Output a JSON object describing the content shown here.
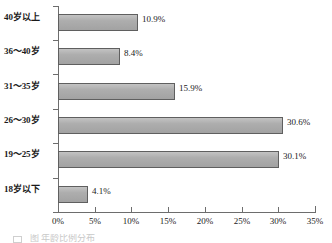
{
  "chart_data": {
    "type": "bar",
    "orientation": "horizontal",
    "title": "",
    "xlabel": "",
    "ylabel": "",
    "categories": [
      "18岁以下",
      "19～25岁",
      "26～30岁",
      "31～35岁",
      "36～40岁",
      "40岁以上"
    ],
    "values": [
      4.1,
      30.1,
      30.6,
      15.9,
      8.4,
      10.9
    ],
    "data_labels": [
      "4.1%",
      "30.1%",
      "30.6%",
      "15.9%",
      "8.4%",
      "10.9%"
    ],
    "xlim": [
      0,
      35
    ],
    "xtick_values": [
      0,
      5,
      10,
      15,
      20,
      25,
      30,
      35
    ],
    "xtick_labels": [
      "0%",
      "5%",
      "10%",
      "15%",
      "20%",
      "25%",
      "30%",
      "35%"
    ],
    "grid": false,
    "legend": null,
    "series": [
      {
        "name": "",
        "values": [
          4.1,
          30.1,
          30.6,
          15.9,
          8.4,
          10.9
        ]
      }
    ],
    "bar_color": "#a9a9a9",
    "bar_border_color": "#5f5f5f",
    "axis_color": "#6d6d6d"
  },
  "caption": {
    "text": "图                   年龄比例分布"
  }
}
